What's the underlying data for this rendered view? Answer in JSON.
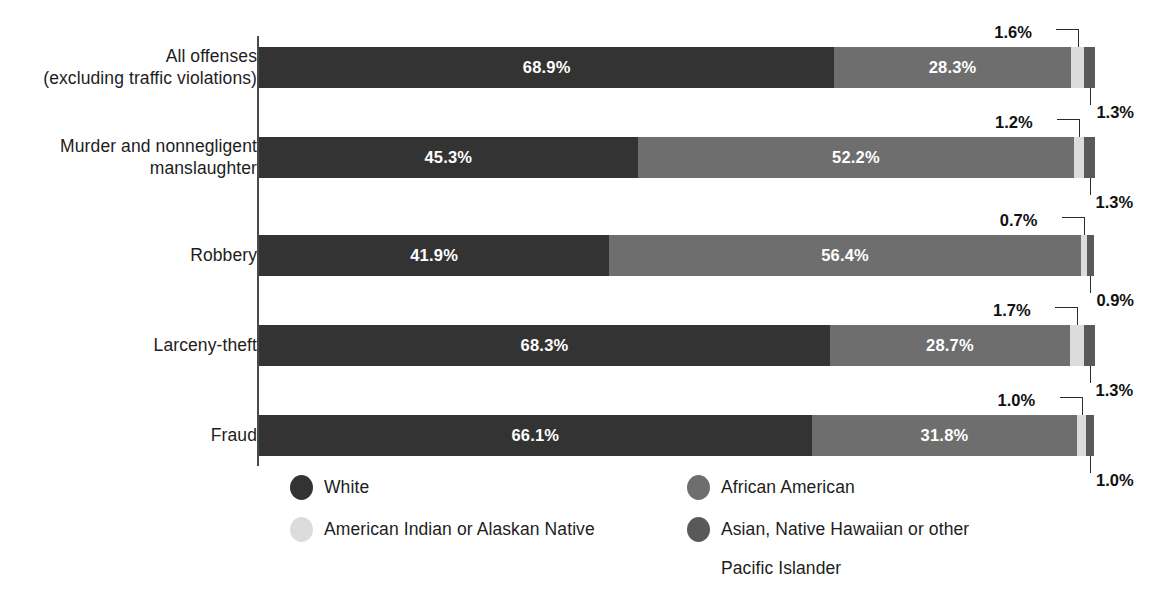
{
  "chart_data": {
    "type": "bar",
    "subtype": "horizontal-100pct-stacked",
    "title": "",
    "xlabel": "",
    "ylabel": "",
    "xlim": [
      0,
      100
    ],
    "grid": false,
    "legend_position": "bottom",
    "categories": [
      "All offenses (excluding traffic violations)",
      "Murder and nonnegligent manslaughter",
      "Robbery",
      "Larceny-theft",
      "Fraud"
    ],
    "series": [
      {
        "name": "White",
        "color": "#333333",
        "values": [
          68.9,
          45.3,
          41.9,
          68.3,
          66.1
        ]
      },
      {
        "name": "African American",
        "color": "#6e6e6e",
        "values": [
          28.3,
          52.2,
          56.4,
          28.7,
          31.8
        ]
      },
      {
        "name": "American Indian or Alaskan Native",
        "color": "#dcdcdc",
        "values": [
          1.6,
          1.2,
          0.7,
          1.7,
          1.0
        ]
      },
      {
        "name": "Asian, Native Hawaiian or other Pacific Islander",
        "color": "#595959",
        "values": [
          1.3,
          1.3,
          0.9,
          1.3,
          1.0
        ]
      }
    ]
  },
  "rows": [
    {
      "label_line1": "All offenses",
      "label_line2": "(excluding traffic violations)",
      "white": "68.9%",
      "african_american": "28.3%",
      "american_indian": "1.6%",
      "asian": "1.3%",
      "white_pct": 68.9,
      "african_american_pct": 28.3,
      "american_indian_pct": 1.6,
      "asian_pct": 1.3
    },
    {
      "label_line1": "Murder and nonnegligent",
      "label_line2": "manslaughter",
      "white": "45.3%",
      "african_american": "52.2%",
      "american_indian": "1.2%",
      "asian": "1.3%",
      "white_pct": 45.3,
      "african_american_pct": 52.2,
      "american_indian_pct": 1.2,
      "asian_pct": 1.3
    },
    {
      "label_line1": "Robbery",
      "label_line2": "",
      "white": "41.9%",
      "african_american": "56.4%",
      "american_indian": "0.7%",
      "asian": "0.9%",
      "white_pct": 41.9,
      "african_american_pct": 56.4,
      "american_indian_pct": 0.7,
      "asian_pct": 0.9
    },
    {
      "label_line1": "Larceny-theft",
      "label_line2": "",
      "white": "68.3%",
      "african_american": "28.7%",
      "american_indian": "1.7%",
      "asian": "1.3%",
      "white_pct": 68.3,
      "african_american_pct": 28.7,
      "american_indian_pct": 1.7,
      "asian_pct": 1.3
    },
    {
      "label_line1": "Fraud",
      "label_line2": "",
      "white": "66.1%",
      "african_american": "31.8%",
      "american_indian": "1.0%",
      "asian": "1.0%",
      "white_pct": 66.1,
      "african_american_pct": 31.8,
      "american_indian_pct": 1.0,
      "asian_pct": 1.0
    }
  ],
  "legend": {
    "left": [
      {
        "label": "White",
        "color": "#333333"
      },
      {
        "label": "American Indian or Alaskan Native",
        "color": "#dcdcdc"
      }
    ],
    "right": [
      {
        "label": "African American",
        "color": "#6e6e6e",
        "label_wrap": ""
      },
      {
        "label": "Asian, Native Hawaiian or other",
        "color": "#595959",
        "label_wrap": "Pacific Islander"
      }
    ]
  },
  "colors": {
    "white_seg": "#333333",
    "african_american_seg": "#6e6e6e",
    "american_indian_seg": "#dcdcdc",
    "asian_seg": "#595959",
    "axis": "#4a4a4a",
    "background": "#ffffff",
    "text": "#1d1d1d"
  }
}
